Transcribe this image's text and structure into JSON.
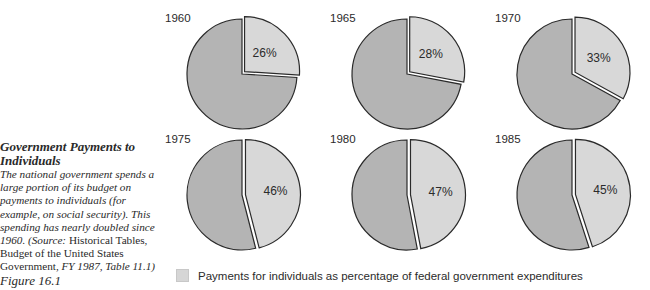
{
  "caption": {
    "title": "Government Payments to Individuals",
    "body": "The national government spends a large portion of its budget on payments to individuals (for example, on social security). This spending has nearly doubled since 1960. (Source:",
    "source": "Historical Tables, Budget of the United States Government,",
    "source_tail": "FY 1987, Table 11.1)",
    "figure_label": "Figure 16.1"
  },
  "legend": {
    "label": "Payments for individuals as percentage of federal government expenditures",
    "swatch_color": "#d6d6d6"
  },
  "colors": {
    "slice": "#d8d8d8",
    "rest": "#b4b4b4",
    "outline": "#2a2a2a"
  },
  "chart_data": {
    "type": "pie",
    "title": "Payments for individuals as percentage of federal government expenditures",
    "categories": [
      "1960",
      "1965",
      "1970",
      "1975",
      "1980",
      "1985"
    ],
    "values": [
      26,
      28,
      33,
      46,
      47,
      45
    ],
    "labels": [
      "26%",
      "28%",
      "33%",
      "46%",
      "47%",
      "45%"
    ],
    "legend": [
      "Payments for individuals as percentage of federal government expenditures"
    ],
    "legend_position": "bottom",
    "layout": "2 rows x 3 columns of exploded pies"
  },
  "pies": [
    {
      "year": "1960",
      "label": "26%",
      "value": 26
    },
    {
      "year": "1965",
      "label": "28%",
      "value": 28
    },
    {
      "year": "1970",
      "label": "33%",
      "value": 33
    },
    {
      "year": "1975",
      "label": "46%",
      "value": 46
    },
    {
      "year": "1980",
      "label": "47%",
      "value": 47
    },
    {
      "year": "1985",
      "label": "45%",
      "value": 45
    }
  ]
}
